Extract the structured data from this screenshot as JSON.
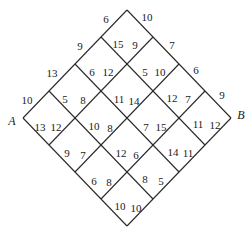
{
  "diagram": {
    "title": "",
    "vertices": {
      "start": "A",
      "end": "B"
    },
    "line_color": "#2a2a2a",
    "labels": [
      {
        "text": "6",
        "x": 106,
        "y": 19
      },
      {
        "text": "10",
        "x": 147,
        "y": 17
      },
      {
        "text": "9",
        "x": 80,
        "y": 46
      },
      {
        "text": "15",
        "x": 118,
        "y": 44
      },
      {
        "text": "9",
        "x": 135,
        "y": 45
      },
      {
        "text": "7",
        "x": 172,
        "y": 45
      },
      {
        "text": "13",
        "x": 52,
        "y": 73
      },
      {
        "text": "6",
        "x": 92,
        "y": 72
      },
      {
        "text": "12",
        "x": 108,
        "y": 72
      },
      {
        "text": "5",
        "x": 145,
        "y": 72
      },
      {
        "text": "10",
        "x": 160,
        "y": 72
      },
      {
        "text": "6",
        "x": 196,
        "y": 70
      },
      {
        "text": "10",
        "x": 27,
        "y": 100
      },
      {
        "text": "5",
        "x": 65,
        "y": 99
      },
      {
        "text": "8",
        "x": 83,
        "y": 100
      },
      {
        "text": "11",
        "x": 119,
        "y": 99
      },
      {
        "text": "14",
        "x": 134,
        "y": 101
      },
      {
        "text": "12",
        "x": 172,
        "y": 98
      },
      {
        "text": "7",
        "x": 188,
        "y": 99
      },
      {
        "text": "9",
        "x": 222,
        "y": 95
      },
      {
        "text": "13",
        "x": 40,
        "y": 127
      },
      {
        "text": "12",
        "x": 56,
        "y": 127
      },
      {
        "text": "10",
        "x": 94,
        "y": 126
      },
      {
        "text": "8",
        "x": 110,
        "y": 128
      },
      {
        "text": "7",
        "x": 146,
        "y": 127
      },
      {
        "text": "15",
        "x": 161,
        "y": 127
      },
      {
        "text": "11",
        "x": 198,
        "y": 124
      },
      {
        "text": "12",
        "x": 215,
        "y": 125
      },
      {
        "text": "9",
        "x": 67,
        "y": 153
      },
      {
        "text": "7",
        "x": 83,
        "y": 155
      },
      {
        "text": "12",
        "x": 121,
        "y": 153
      },
      {
        "text": "6",
        "x": 136,
        "y": 155
      },
      {
        "text": "14",
        "x": 173,
        "y": 152
      },
      {
        "text": "11",
        "x": 188,
        "y": 153
      },
      {
        "text": "6",
        "x": 94,
        "y": 181
      },
      {
        "text": "8",
        "x": 109,
        "y": 182
      },
      {
        "text": "8",
        "x": 145,
        "y": 179
      },
      {
        "text": "5",
        "x": 161,
        "y": 181
      },
      {
        "text": "10",
        "x": 120,
        "y": 206
      },
      {
        "text": "10",
        "x": 136,
        "y": 208
      }
    ],
    "vertex_labels": [
      {
        "text": "A",
        "x": 12,
        "y": 121
      },
      {
        "text": "B",
        "x": 241,
        "y": 115
      }
    ]
  }
}
